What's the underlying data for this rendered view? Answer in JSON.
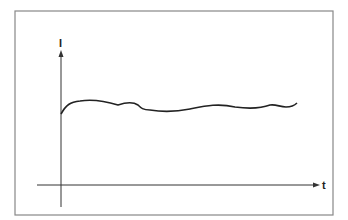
{
  "diagram": {
    "y_axis_label": "I",
    "x_axis_label": "t",
    "curve_description": "Current I vs time t: rises quickly then stays roughly constant with small fluctuations",
    "colors": {
      "line": "#222222",
      "frame": "#888888",
      "background": "#ffffff"
    }
  }
}
